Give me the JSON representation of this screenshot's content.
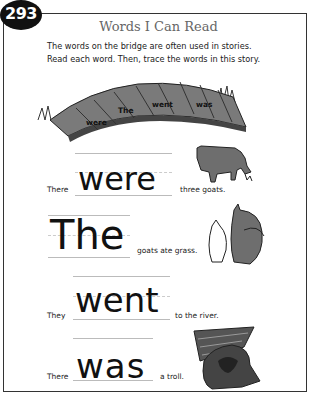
{
  "page_number": "293",
  "title": "Words I Can Read",
  "instructions": [
    "The words on the bridge are often used in stories.",
    "Read each word. Then, trace the words in this story."
  ],
  "bridge_words": [
    "were",
    "The",
    "went",
    "was"
  ],
  "sentences": [
    {
      "before": "There",
      "trace_word": "were",
      "after": "three goats.",
      "art": "goat-grazing"
    },
    {
      "before": "",
      "trace_word": "The",
      "after": "goats ate grass.",
      "art": "two-goats"
    },
    {
      "before": "They",
      "trace_word": "went",
      "after": "to the river.",
      "art": ""
    },
    {
      "before": "There",
      "trace_word": "was",
      "after": "a troll.",
      "art": "troll-under-bridge"
    }
  ],
  "colors": {
    "frame": "#333333",
    "badge": "#111111",
    "title": "#666666",
    "art_gray": "#6e6e6e"
  }
}
